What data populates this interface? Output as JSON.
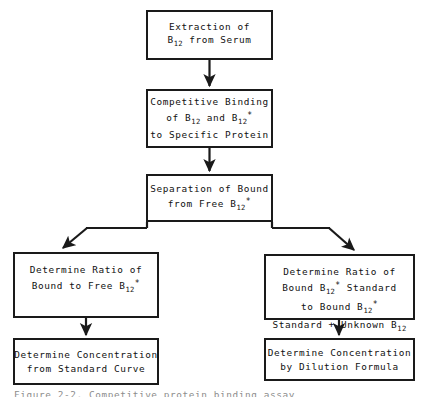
{
  "figure": {
    "type": "flowchart",
    "caption": "Figure 2-2. Competitive protein binding assay",
    "background_color": "#ffffff",
    "line_color": "#1a1a1a",
    "text_color": "#111111"
  },
  "nodes": {
    "extraction": {
      "name": "extraction-of-b12-from-serum",
      "lines": [
        "Extraction of",
        "B12 from Serum"
      ],
      "line1": "Extraction of",
      "line2_pre": "B",
      "line2_sub": "12",
      "line2_post": " from Serum"
    },
    "binding": {
      "name": "competitive-binding",
      "line1": "Competitive Binding",
      "line2_a": "of B",
      "line2_sub_a": "12",
      "line2_b": " and B",
      "line2_sub_b": "12",
      "line2_star": "*",
      "line3": "to Specific Protein"
    },
    "separation": {
      "name": "separation-of-bound-from-free",
      "line1": "Separation of Bound",
      "line2_pre": "from Free B",
      "line2_sub": "12",
      "line2_star": "*"
    },
    "ratio_free": {
      "name": "determine-ratio-bound-to-free",
      "line1": "Determine Ratio of",
      "line2_pre": "Bound to Free B",
      "line2_sub": "12",
      "line2_star": "*"
    },
    "ratio_standard": {
      "name": "determine-ratio-bound-standard",
      "line1": "Determine Ratio of",
      "line2_pre": "Bound B",
      "line2_sub": "12",
      "line2_star": "*",
      "line2_post": " Standard",
      "line3_pre": "to Bound B",
      "line3_sub": "12",
      "line3_star": "*",
      "line4_pre": "Standard + Unknown B",
      "line4_sub": "12"
    },
    "conc_curve": {
      "name": "determine-concentration-standard-curve",
      "line1": "Determine Concentration",
      "line2": "from Standard Curve"
    },
    "conc_dilution": {
      "name": "determine-concentration-dilution-formula",
      "line1": "Determine Concentration",
      "line2": "by Dilution Formula"
    }
  },
  "connectors": [
    {
      "name": "arrow-extraction-to-binding",
      "from": "extraction",
      "to": "binding",
      "style": "vertical-arrow"
    },
    {
      "name": "arrow-binding-to-separation",
      "from": "binding",
      "to": "separation",
      "style": "vertical-arrow"
    },
    {
      "name": "arrow-separation-to-ratio-free",
      "from": "separation",
      "to": "ratio_free",
      "style": "diagonal-arrow-left"
    },
    {
      "name": "arrow-separation-to-ratio-standard",
      "from": "separation",
      "to": "ratio_standard",
      "style": "diagonal-arrow-right"
    },
    {
      "name": "arrow-ratio-free-to-conc-curve",
      "from": "ratio_free",
      "to": "conc_curve",
      "style": "vertical-arrow"
    },
    {
      "name": "arrow-ratio-standard-to-conc-dilution",
      "from": "ratio_standard",
      "to": "conc_dilution",
      "style": "vertical-arrow"
    }
  ]
}
